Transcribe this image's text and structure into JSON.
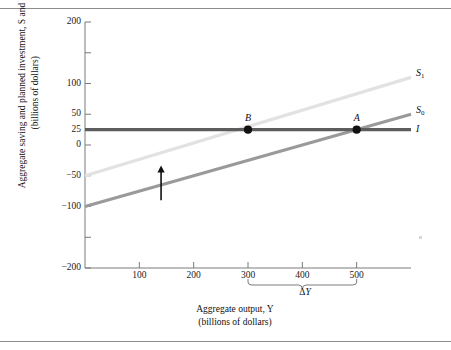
{
  "figure": {
    "has_top_rule": true,
    "has_bottom_rule": true
  },
  "chart_data": {
    "type": "line",
    "title": "",
    "xlabel": "Aggregate output, Y",
    "xlabel_sub": "(billions of dollars)",
    "ylabel": "Aggregate saving and planned investment, S and I",
    "ylabel_sub": "(billions of dollars)",
    "xlim": [
      0,
      600
    ],
    "ylim": [
      -200,
      200
    ],
    "grid": false,
    "legend": "inline-right",
    "xticks": [
      100,
      200,
      300,
      400,
      500
    ],
    "xtick_labels": [
      "100",
      "200",
      "300",
      "400",
      "500"
    ],
    "yticks": [
      -200,
      -150,
      -100,
      -50,
      0,
      25,
      50,
      100,
      150,
      200
    ],
    "ytick_labels": [
      "-200",
      "",
      "-100",
      "-50",
      "0",
      "25",
      "50",
      "100",
      "",
      "200"
    ],
    "series": [
      {
        "name": "S1",
        "label": "S",
        "label_sub": "1",
        "color": "#e2e2e2",
        "width": 3.2,
        "x": [
          0,
          600
        ],
        "y": [
          -50,
          110
        ],
        "note": "shifted saving function; crosses I at Y = 300"
      },
      {
        "name": "S0",
        "label": "S",
        "label_sub": "0",
        "color": "#9a9a9a",
        "width": 3.2,
        "x": [
          0,
          600
        ],
        "y": [
          -100,
          50
        ],
        "note": "original saving function; crosses I at Y = 500"
      },
      {
        "name": "I",
        "label": "I",
        "label_sub": "",
        "color": "#5d5d5d",
        "width": 3.4,
        "x": [
          0,
          600
        ],
        "y": [
          25,
          25
        ],
        "note": "planned investment, horizontal at 25"
      }
    ],
    "points": [
      {
        "label": "B",
        "x": 300,
        "y": 25,
        "color": "#111111"
      },
      {
        "label": "A",
        "x": 500,
        "y": 25,
        "color": "#111111"
      }
    ],
    "annotations": [
      {
        "type": "arrow",
        "name": "shift-arrow",
        "direction": "up",
        "x": 140,
        "y_from": -90,
        "y_to": -35
      },
      {
        "type": "brace",
        "name": "delta-y-brace",
        "x_from": 300,
        "x_to": 500,
        "label": "ΔY"
      }
    ]
  }
}
